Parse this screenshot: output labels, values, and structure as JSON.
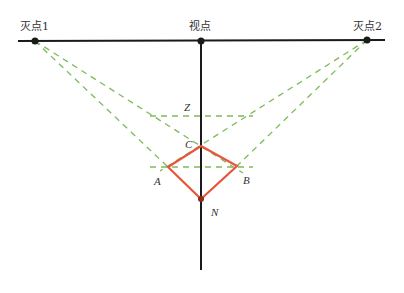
{
  "labels": {
    "vanishing_point_1": "灭点1",
    "viewpoint": "视点",
    "vanishing_point_2": "灭点2"
  },
  "points": {
    "A": "A",
    "B": "B",
    "C": "C",
    "N": "N",
    "Z": "Z"
  },
  "colors": {
    "horizon_line": "#1a1a1a",
    "construction_dashed": "#7dbb5a",
    "square_outline": "#e8553a",
    "text": "#333333"
  }
}
